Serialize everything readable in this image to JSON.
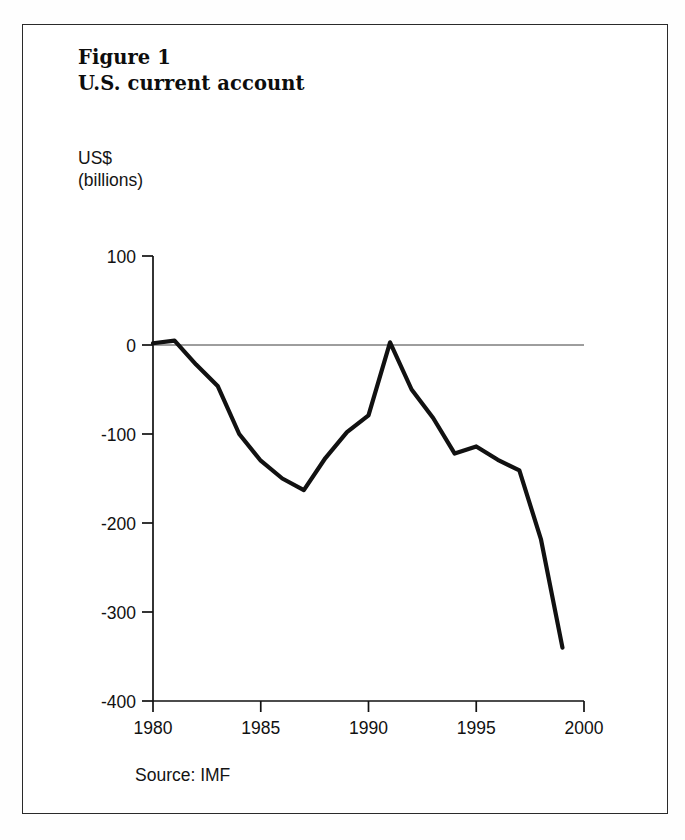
{
  "figure": {
    "title_line1": "Figure 1",
    "title_line2": "U.S. current account",
    "unit_line1": "US$",
    "unit_line2": "(billions)",
    "source": "Source: IMF",
    "frame_color": "#2a2a2a",
    "line_color": "#111111",
    "background": "#ffffff"
  },
  "chart_data": {
    "type": "line",
    "title": "U.S. current account",
    "subtitle": "Figure 1",
    "xlabel": "",
    "ylabel": "US$ (billions)",
    "unit": "US$ (billions)",
    "source": "Source: IMF",
    "xlim": [
      1980,
      2000
    ],
    "ylim": [
      -400,
      100
    ],
    "xticks": [
      1980,
      1985,
      1990,
      1995,
      2000
    ],
    "yticks": [
      100,
      0,
      -100,
      -200,
      -300,
      -400
    ],
    "xtick_labels": [
      "1980",
      "1985",
      "1990",
      "1995",
      "2000"
    ],
    "ytick_labels": [
      "100",
      "0",
      "-100",
      "-200",
      "-300",
      "-400"
    ],
    "grid": false,
    "legend": false,
    "zero_line": true,
    "series": [
      {
        "name": "U.S. current account balance",
        "x": [
          1980,
          1981,
          1982,
          1983,
          1984,
          1985,
          1986,
          1987,
          1988,
          1989,
          1990,
          1991,
          1992,
          1993,
          1994,
          1995,
          1996,
          1997,
          1998,
          1999
        ],
        "values": [
          2,
          5,
          -22,
          -46,
          -100,
          -130,
          -150,
          -163,
          -127,
          -98,
          -79,
          3,
          -50,
          -82,
          -122,
          -114,
          -129,
          -141,
          -218,
          -340
        ]
      }
    ]
  }
}
